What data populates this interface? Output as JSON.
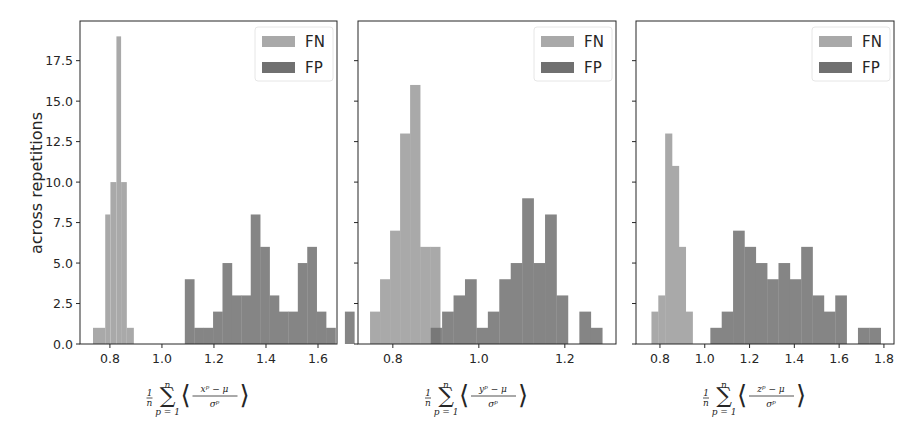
{
  "figure": {
    "ylabel": "across repetitions",
    "legend": [
      {
        "label": "FN",
        "color": "#a9a9a9"
      },
      {
        "label": "FP",
        "color": "#707070"
      }
    ]
  },
  "chart_data": [
    {
      "type": "bar",
      "subtype": "histogram",
      "title": "",
      "xlabel": "1/n Σ_{p=1}^{n} ⟨(x^p − μ_x^p)/σ_x^p⟩",
      "xlabel_var": "x",
      "ylabel": "across repetitions",
      "xlim": [
        0.685,
        1.673
      ],
      "ylim": [
        0,
        19.95
      ],
      "xticks": [
        0.8,
        1.0,
        1.2,
        1.4,
        1.6
      ],
      "xtick_labels": [
        "0.8",
        "1.0",
        "1.2",
        "1.4",
        "1.6"
      ],
      "yticks": [
        0,
        2.5,
        5,
        7.5,
        10,
        12.5,
        15,
        17.5
      ],
      "ytick_labels": [
        "0.0",
        "2.5",
        "5.0",
        "7.5",
        "10.0",
        "12.5",
        "15.0",
        "17.5"
      ],
      "grid": false,
      "legend_position": "upper right",
      "series": [
        {
          "name": "FN",
          "bin_start": 0.735,
          "bin_width": 0.0355,
          "values": [
            1,
            8,
            10,
            19,
            10,
            1
          ],
          "bins_override": [
            [
              0.735,
              0.782,
              1
            ],
            [
              0.782,
              0.802,
              8
            ],
            [
              0.802,
              0.825,
              10
            ],
            [
              0.825,
              0.843,
              19
            ],
            [
              0.843,
              0.865,
              10
            ],
            [
              0.865,
              0.892,
              1
            ]
          ]
        },
        {
          "name": "FP",
          "bin_start": 1.088,
          "bin_width": 0.0362,
          "values": [
            4,
            1,
            1,
            2,
            5,
            3,
            3,
            8,
            6,
            3,
            2,
            2,
            5,
            6,
            2,
            1,
            0,
            2
          ]
        }
      ]
    },
    {
      "type": "bar",
      "subtype": "histogram",
      "title": "",
      "xlabel": "1/n Σ_{p=1}^{n} ⟨(y^p − μ_y^p)/σ_y^p⟩",
      "xlabel_var": "y",
      "ylabel": "",
      "xlim": [
        0.719,
        1.319
      ],
      "ylim": [
        0,
        19.95
      ],
      "xticks": [
        0.8,
        1.0,
        1.2
      ],
      "xtick_labels": [
        "0.8",
        "1.0",
        "1.2"
      ],
      "yticks": [
        0,
        2.5,
        5,
        7.5,
        10,
        12.5,
        15,
        17.5
      ],
      "ytick_labels": [],
      "grid": false,
      "legend_position": "upper right",
      "series": [
        {
          "name": "FN",
          "bin_start": 0.747,
          "bin_width": 0.0233,
          "values": [
            2,
            4,
            7,
            13,
            16,
            6,
            6
          ]
        },
        {
          "name": "FP",
          "bin_start": 0.888,
          "bin_width": 0.0266,
          "values": [
            1,
            2,
            3,
            4,
            1,
            2,
            4,
            5,
            9,
            5,
            8,
            3,
            0,
            2,
            1
          ]
        }
      ]
    },
    {
      "type": "bar",
      "subtype": "histogram",
      "title": "",
      "xlabel": "1/n Σ_{p=1}^{n} ⟨(z^p − μ_z^p)/σ_z^p⟩",
      "xlabel_var": "z",
      "ylabel": "",
      "xlim": [
        0.693,
        1.845
      ],
      "ylim": [
        0,
        19.95
      ],
      "xticks": [
        0.8,
        1.0,
        1.2,
        1.4,
        1.6,
        1.8
      ],
      "xtick_labels": [
        "0.8",
        "1.0",
        "1.2",
        "1.4",
        "1.6",
        "1.8"
      ],
      "yticks": [
        0,
        2.5,
        5,
        7.5,
        10,
        12.5,
        15,
        17.5
      ],
      "ytick_labels": [],
      "grid": false,
      "legend_position": "upper right",
      "series": [
        {
          "name": "FN",
          "bin_start": 0.762,
          "bin_width": 0.0306,
          "values": [
            2,
            3,
            13,
            11,
            6,
            2
          ]
        },
        {
          "name": "FP",
          "bin_start": 1.025,
          "bin_width": 0.0507,
          "values": [
            1,
            2,
            7,
            6,
            5,
            4,
            5,
            4,
            6,
            3,
            2,
            3,
            0,
            1,
            1
          ]
        }
      ]
    }
  ]
}
